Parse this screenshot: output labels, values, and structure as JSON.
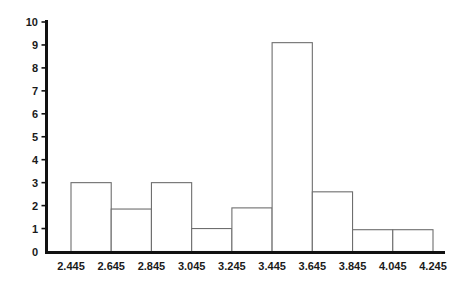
{
  "chart_data": {
    "type": "bar",
    "title": "",
    "subtitle": "",
    "xlabel": "",
    "ylabel": "",
    "grid": false,
    "legend": false,
    "legend_position": "none",
    "bin_width": 0.2,
    "bin_edges": [
      2.445,
      2.645,
      2.845,
      3.045,
      3.245,
      3.445,
      3.645,
      3.845,
      4.045,
      4.245
    ],
    "categories": [
      "2.445-2.645",
      "2.645-2.845",
      "2.845-3.045",
      "3.045-3.245",
      "3.245-3.445",
      "3.445-3.645",
      "3.645-3.845",
      "3.845-4.045",
      "4.045-4.245"
    ],
    "values": [
      3.0,
      1.85,
      3.0,
      1.0,
      1.9,
      9.1,
      2.6,
      0.95,
      0.95
    ],
    "xlim": [
      2.445,
      4.245
    ],
    "ylim": [
      0,
      10
    ],
    "xticks": [
      "2.445",
      "2.645",
      "2.845",
      "3.045",
      "3.245",
      "3.445",
      "3.645",
      "3.845",
      "4.045",
      "4.245"
    ],
    "yticks": [
      "0",
      "1",
      "2",
      "3",
      "4",
      "5",
      "6",
      "7",
      "8",
      "9",
      "10"
    ],
    "ytick_values": [
      0,
      1,
      2,
      3,
      4,
      5,
      6,
      7,
      8,
      9,
      10
    ],
    "bar_fill_color": "#ffffff",
    "bar_edge_color": "#6e6e6e",
    "axis_color": "#111111",
    "background_color": "#ffffff"
  }
}
